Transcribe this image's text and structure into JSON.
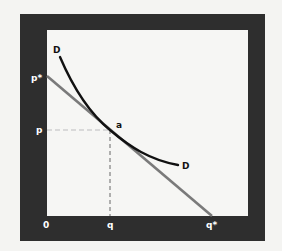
{
  "diagram": {
    "type": "demand-curve-with-tangent-line",
    "frame": {
      "outer_color": "#2e2e2e",
      "inner_color": "#f6f6f4"
    },
    "labels": {
      "curve_top": "D",
      "curve_end": "D",
      "tangent_point": "a",
      "price_star": "p*",
      "price": "p",
      "origin": "0",
      "quantity": "q",
      "quantity_star": "q*"
    },
    "colors": {
      "demand_curve": "#111111",
      "tangent_line": "#7a7a7a",
      "dashed_guide": "#d8d8d8",
      "label_on_frame": "#ffffff",
      "label_on_plot": "#111111"
    }
  }
}
